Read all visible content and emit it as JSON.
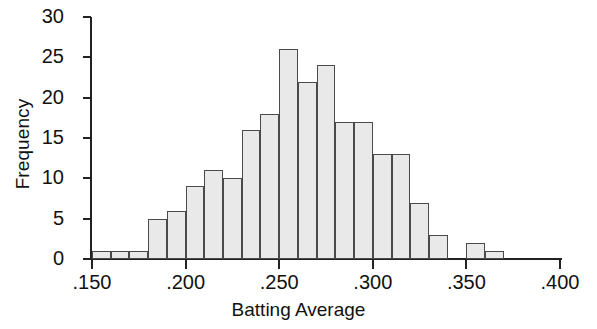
{
  "chart_data": {
    "type": "bar",
    "title": "",
    "subtitle": "",
    "xlabel": "Batting Average",
    "ylabel": "Frequency",
    "xlim": [
      0.15,
      0.4
    ],
    "ylim": [
      0,
      30
    ],
    "bin_width": 0.01,
    "grid": false,
    "legend": null,
    "x_tick_labels": [
      ".150",
      ".200",
      ".250",
      ".300",
      ".350",
      ".400"
    ],
    "x_tick_values": [
      0.15,
      0.2,
      0.25,
      0.3,
      0.35,
      0.4
    ],
    "y_tick_labels": [
      "0",
      "5",
      "10",
      "15",
      "20",
      "25",
      "30"
    ],
    "y_tick_values": [
      0,
      5,
      10,
      15,
      20,
      25,
      30
    ],
    "categories": [
      ".150-.160",
      ".160-.170",
      ".170-.180",
      ".180-.190",
      ".190-.200",
      ".200-.210",
      ".210-.220",
      ".220-.230",
      ".230-.240",
      ".240-.250",
      ".250-.260",
      ".260-.270",
      ".270-.280",
      ".280-.290",
      ".290-.300",
      ".300-.310",
      ".310-.320",
      ".320-.330",
      ".330-.340",
      ".340-.350",
      ".350-.360",
      ".360-.370"
    ],
    "bin_edges": [
      0.15,
      0.16,
      0.17,
      0.18,
      0.19,
      0.2,
      0.21,
      0.22,
      0.23,
      0.24,
      0.25,
      0.26,
      0.27,
      0.28,
      0.29,
      0.3,
      0.31,
      0.32,
      0.33,
      0.34,
      0.35,
      0.36,
      0.37
    ],
    "values": [
      1,
      1,
      1,
      5,
      6,
      9,
      11,
      10,
      16,
      18,
      26,
      22,
      24,
      17,
      17,
      13,
      13,
      7,
      3,
      0,
      2,
      1
    ],
    "bar_fill_color": "#e9e9e9",
    "bar_edge_color": "#4a4a4a",
    "axis_color": "#222222",
    "background_color": "#ffffff"
  }
}
